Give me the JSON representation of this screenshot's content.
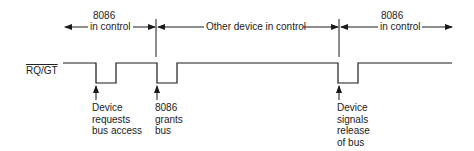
{
  "diagram": {
    "signal_label": "RQ/GT",
    "phases": [
      {
        "label_line1": "8086",
        "label_line2": "in control"
      },
      {
        "label_line1": "Other device in control"
      },
      {
        "label_line1": "8086",
        "label_line2": "in control"
      }
    ],
    "annotations": [
      {
        "lines": [
          "Device",
          "requests",
          "bus access"
        ]
      },
      {
        "lines": [
          "8086",
          "grants",
          "bus"
        ]
      },
      {
        "lines": [
          "Device",
          "signals",
          "release",
          "of bus"
        ]
      }
    ],
    "colors": {
      "line": "#1a1a1a",
      "background": "#ffffff"
    }
  }
}
